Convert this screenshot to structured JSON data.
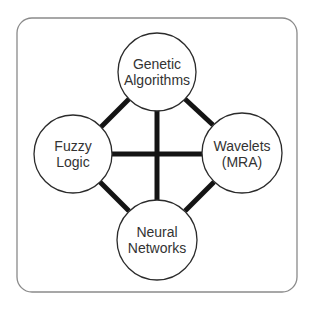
{
  "diagram": {
    "type": "network",
    "frame": {
      "border_color": "#8a8a8a",
      "background": "#ffffff"
    },
    "edge_color": "#141414",
    "node_border_color": "#2b2b2b",
    "text_color": "#333333",
    "nodes": [
      {
        "id": "genetic",
        "position": "top",
        "lines": [
          "Genetic",
          "Algorithms"
        ]
      },
      {
        "id": "fuzzy",
        "position": "left",
        "lines": [
          "Fuzzy",
          "Logic"
        ]
      },
      {
        "id": "wavelets",
        "position": "right",
        "lines": [
          "Wavelets",
          "(MRA)"
        ]
      },
      {
        "id": "neural",
        "position": "bottom",
        "lines": [
          "Neural",
          "Networks"
        ]
      }
    ],
    "edges": [
      {
        "from": "genetic",
        "to": "fuzzy"
      },
      {
        "from": "genetic",
        "to": "wavelets"
      },
      {
        "from": "genetic",
        "to": "neural"
      },
      {
        "from": "fuzzy",
        "to": "wavelets"
      },
      {
        "from": "fuzzy",
        "to": "neural"
      },
      {
        "from": "wavelets",
        "to": "neural"
      }
    ]
  }
}
